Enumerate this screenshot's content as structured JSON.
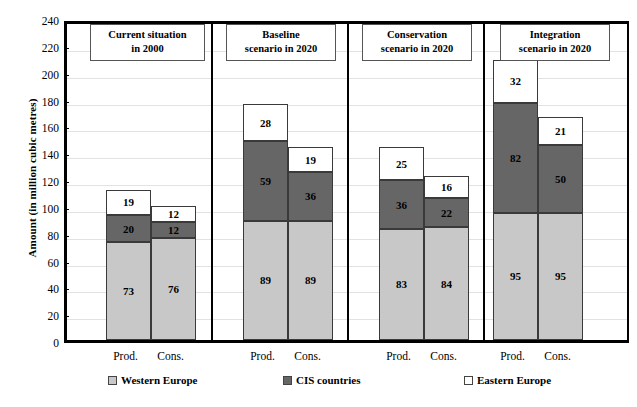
{
  "chart_data": {
    "type": "bar",
    "title": "",
    "xlabel": "",
    "ylabel": "Amount (in million cubic metres)",
    "ylim": [
      0,
      240
    ],
    "ytick_step": 20,
    "yticks": [
      "240",
      "220",
      "200",
      "180",
      "160",
      "140",
      "120",
      "100",
      "80",
      "60",
      "40",
      "20",
      "0"
    ],
    "grid": true,
    "stacked": true,
    "legend_position": "bottom",
    "series": [
      {
        "name": "Western Europe",
        "color": "#c8c8c8",
        "values": [
          73,
          76,
          89,
          89,
          83,
          84,
          95,
          95
        ]
      },
      {
        "name": "CIS countries",
        "color": "#666666",
        "values": [
          20,
          12,
          59,
          36,
          36,
          22,
          82,
          50
        ]
      },
      {
        "name": "Eastern Europe",
        "color": "#ffffff",
        "values": [
          19,
          12,
          28,
          19,
          25,
          16,
          32,
          21
        ]
      }
    ],
    "categories": [
      "Prod.",
      "Cons.",
      "Prod.",
      "Cons.",
      "Prod.",
      "Cons.",
      "Prod.",
      "Cons."
    ],
    "totals": [
      112,
      100,
      176,
      144,
      144,
      122,
      209,
      166
    ],
    "groups": [
      {
        "title_line1": "Current  situation",
        "title_line2": "in 2000",
        "bars": [
          "Prod.",
          "Cons."
        ]
      },
      {
        "title_line1": "Baseline",
        "title_line2": "scenario in 2020",
        "bars": [
          "Prod.",
          "Cons."
        ]
      },
      {
        "title_line1": "Conservation",
        "title_line2": "scenario in 2020",
        "bars": [
          "Prod.",
          "Cons."
        ]
      },
      {
        "title_line1": "Integration",
        "title_line2": "scenario in 2020",
        "bars": [
          "Prod.",
          "Cons."
        ]
      }
    ]
  },
  "axis": {
    "y_title": "Amount (in million cubic metres)",
    "ticks": [
      "240",
      "220",
      "200",
      "180",
      "160",
      "140",
      "120",
      "100",
      "80",
      "60",
      "40",
      "20",
      "0"
    ]
  },
  "panels": [
    {
      "line1": "Current  situation",
      "line2": "in 2000"
    },
    {
      "line1": "Baseline",
      "line2": "scenario in 2020"
    },
    {
      "line1": "Conservation",
      "line2": "scenario in 2020"
    },
    {
      "line1": "Integration",
      "line2": "scenario in 2020"
    }
  ],
  "bars": [
    {
      "group": 0,
      "label": "Prod.",
      "west": "73",
      "cis": "20",
      "east": "19"
    },
    {
      "group": 0,
      "label": "Cons.",
      "west": "76",
      "cis": "12",
      "east": "12"
    },
    {
      "group": 1,
      "label": "Prod.",
      "west": "89",
      "cis": "59",
      "east": "28"
    },
    {
      "group": 1,
      "label": "Cons.",
      "west": "89",
      "cis": "36",
      "east": "19"
    },
    {
      "group": 2,
      "label": "Prod.",
      "west": "83",
      "cis": "36",
      "east": "25"
    },
    {
      "group": 2,
      "label": "Cons.",
      "west": "84",
      "cis": "22",
      "east": "16"
    },
    {
      "group": 3,
      "label": "Prod.",
      "west": "95",
      "cis": "82",
      "east": "32"
    },
    {
      "group": 3,
      "label": "Cons.",
      "west": "95",
      "cis": "50",
      "east": "21"
    }
  ],
  "xticks": [
    "Prod.",
    "Cons.",
    "Prod.",
    "Cons.",
    "Prod.",
    "Cons.",
    "Prod.",
    "Cons."
  ],
  "legend": [
    {
      "label": "Western Europe",
      "color": "#c8c8c8"
    },
    {
      "label": "CIS countries",
      "color": "#666666"
    },
    {
      "label": "Eastern Europe",
      "color": "#ffffff"
    }
  ]
}
